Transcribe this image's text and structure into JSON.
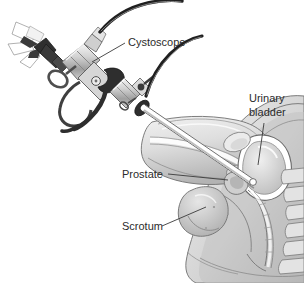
{
  "figure": {
    "type": "medical-line-illustration",
    "style": "grayscale sagittal cross-section of male pelvis with cystoscope instrument",
    "background_color": "#ffffff",
    "ink_color": "#2b2b2b"
  },
  "labels": {
    "cystoscope": "Cystoscope",
    "urinary_bladder_line1": "Urinary",
    "urinary_bladder_line2": "bladder",
    "prostate": "Prostate",
    "scrotum": "Scrotum"
  },
  "palette": {
    "outline": "#4a4a4a",
    "tissue_light": "#e8e8e8",
    "tissue_mid": "#cfcfcf",
    "tissue_dark": "#a8a8a8",
    "tissue_darker": "#8d8d8d",
    "metal_light": "#dcdcdc",
    "metal_mid": "#b4b4b4",
    "instrument_dark": "#3a3a3a",
    "cable_dark": "#1f1f1f",
    "white": "#ffffff"
  },
  "parts": {
    "eyepiece": "eyepiece",
    "light_rays": "light-rays",
    "light_cable": "light-cable",
    "irrigation_cable": "irrigation-cable",
    "finger_ring": "finger-ring",
    "thumb_loop": "thumb-loop",
    "trigger_lever": "trigger-lever",
    "barrel": "barrel",
    "stopcock": "stopcock",
    "sheath": "sheath-shaft",
    "body_outline": "body-outline",
    "penis": "penis",
    "urethra": "urethra",
    "bladder": "bladder",
    "prostate_gland": "prostate-gland",
    "scrotum_sac": "scrotum-sac",
    "rectum": "rectum",
    "sacrum": "sacrum",
    "pubic_bone": "pubic-bone"
  }
}
